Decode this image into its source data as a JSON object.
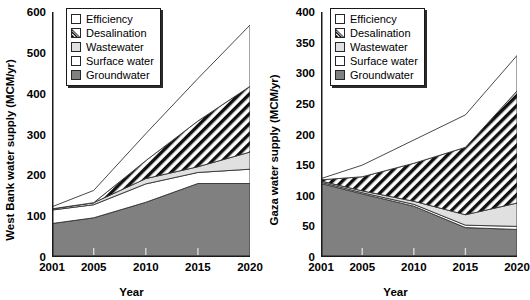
{
  "chart_data": [
    {
      "type": "area",
      "stacked": true,
      "panel": "left",
      "title": "",
      "xlabel": "Year",
      "ylabel": "West Bank water supply (MCM/yr)",
      "x": [
        2001,
        2005,
        2010,
        2015,
        2020
      ],
      "xlim": [
        2001,
        2020
      ],
      "ylim": [
        0,
        600
      ],
      "yticks": [
        0,
        100,
        200,
        300,
        400,
        500,
        600
      ],
      "xticks": [
        2001,
        2005,
        2010,
        2015,
        2020
      ],
      "grid": false,
      "legend_position": "top-left",
      "series": [
        {
          "name": "Groundwater",
          "color": "#808080",
          "pattern": "solid",
          "values": [
            82,
            96,
            134,
            180,
            180
          ]
        },
        {
          "name": "Surface water",
          "color": "#ffffff",
          "pattern": "solid",
          "values": [
            33,
            32,
            45,
            27,
            35
          ]
        },
        {
          "name": "Wastewater",
          "color": "#e0e0e0",
          "pattern": "solid",
          "values": [
            3,
            5,
            13,
            14,
            42
          ]
        },
        {
          "name": "Desalination",
          "color": "#ffffff",
          "pattern": "diagonal",
          "values": [
            0,
            0,
            44,
            112,
            161
          ]
        },
        {
          "name": "Efficiency",
          "color": "#ffffff",
          "pattern": "solid",
          "values": [
            5,
            30,
            66,
            104,
            150
          ]
        }
      ],
      "totals": [
        123,
        163,
        302,
        437,
        568
      ]
    },
    {
      "type": "area",
      "stacked": true,
      "panel": "right",
      "title": "",
      "xlabel": "Year",
      "ylabel": "Gaza water supply (MCM/yr)",
      "x": [
        2001,
        2005,
        2010,
        2015,
        2020
      ],
      "xlim": [
        2001,
        2020
      ],
      "ylim": [
        0,
        400
      ],
      "yticks": [
        0,
        50,
        100,
        150,
        200,
        250,
        300,
        350,
        400
      ],
      "xticks": [
        2001,
        2005,
        2010,
        2015,
        2020
      ],
      "grid": false,
      "legend_position": "top-left",
      "series": [
        {
          "name": "Groundwater",
          "color": "#808080",
          "pattern": "solid",
          "values": [
            120,
            103,
            83,
            48,
            45
          ]
        },
        {
          "name": "Surface water",
          "color": "#ffffff",
          "pattern": "solid",
          "values": [
            2,
            2,
            3,
            4,
            5
          ]
        },
        {
          "name": "Wastewater",
          "color": "#e0e0e0",
          "pattern": "solid",
          "values": [
            2,
            3,
            5,
            17,
            38
          ]
        },
        {
          "name": "Desalination",
          "color": "#ffffff",
          "pattern": "diagonal",
          "values": [
            2,
            23,
            62,
            110,
            183
          ]
        },
        {
          "name": "Efficiency",
          "color": "#ffffff",
          "pattern": "solid",
          "values": [
            2,
            19,
            38,
            53,
            58
          ]
        }
      ],
      "totals": [
        128,
        150,
        191,
        232,
        329
      ]
    }
  ],
  "panels": {
    "left": {
      "ylabel": "West Bank water supply (MCM/yr)",
      "xlabel": "Year",
      "yticks": [
        "600",
        "500",
        "400",
        "300",
        "200",
        "100",
        "0"
      ],
      "xticks": [
        "2001",
        "2005",
        "2010",
        "2015",
        "2020"
      ]
    },
    "right": {
      "ylabel": "Gaza water supply (MCM/yr)",
      "xlabel": "Year",
      "yticks": [
        "400",
        "350",
        "300",
        "250",
        "200",
        "150",
        "100",
        "50",
        "0"
      ],
      "xticks": [
        "2001",
        "2005",
        "2010",
        "2015",
        "2020"
      ]
    }
  },
  "legend": {
    "items": [
      {
        "label": "Efficiency",
        "swatch": "efficiency-swatch"
      },
      {
        "label": "Desalination",
        "swatch": "desalination-swatch"
      },
      {
        "label": "Wastewater",
        "swatch": "wastewater-swatch"
      },
      {
        "label": "Surface water",
        "swatch": "surface-water-swatch"
      },
      {
        "label": "Groundwater",
        "swatch": "groundwater-swatch"
      }
    ]
  },
  "colors": {
    "groundwater": "#808080",
    "wastewater": "#e0e0e0",
    "surface_water": "#ffffff",
    "efficiency": "#ffffff",
    "desalination_hatch": "#111111",
    "axis": "#1a1a1a",
    "background": "#ffffff"
  }
}
